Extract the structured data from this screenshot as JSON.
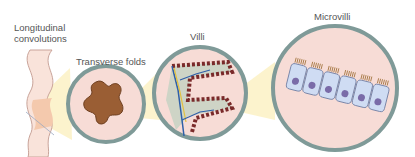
{
  "labels": {
    "longitudinal": [
      "Longitudinal",
      "convolutions"
    ],
    "transverse": "Transverse folds",
    "villi": "Villi",
    "microvilli": "Microvilli"
  },
  "colors": {
    "ring": "#7f9a98",
    "ring_inner": "#5d7775",
    "background_pink": "#f7dcd6",
    "fold_brown": "#9a5e34",
    "highlight_yellow": "#fbf0c0",
    "cell_blue": "#cfdcf3",
    "nucleus_purple": "#7a6ba8"
  }
}
